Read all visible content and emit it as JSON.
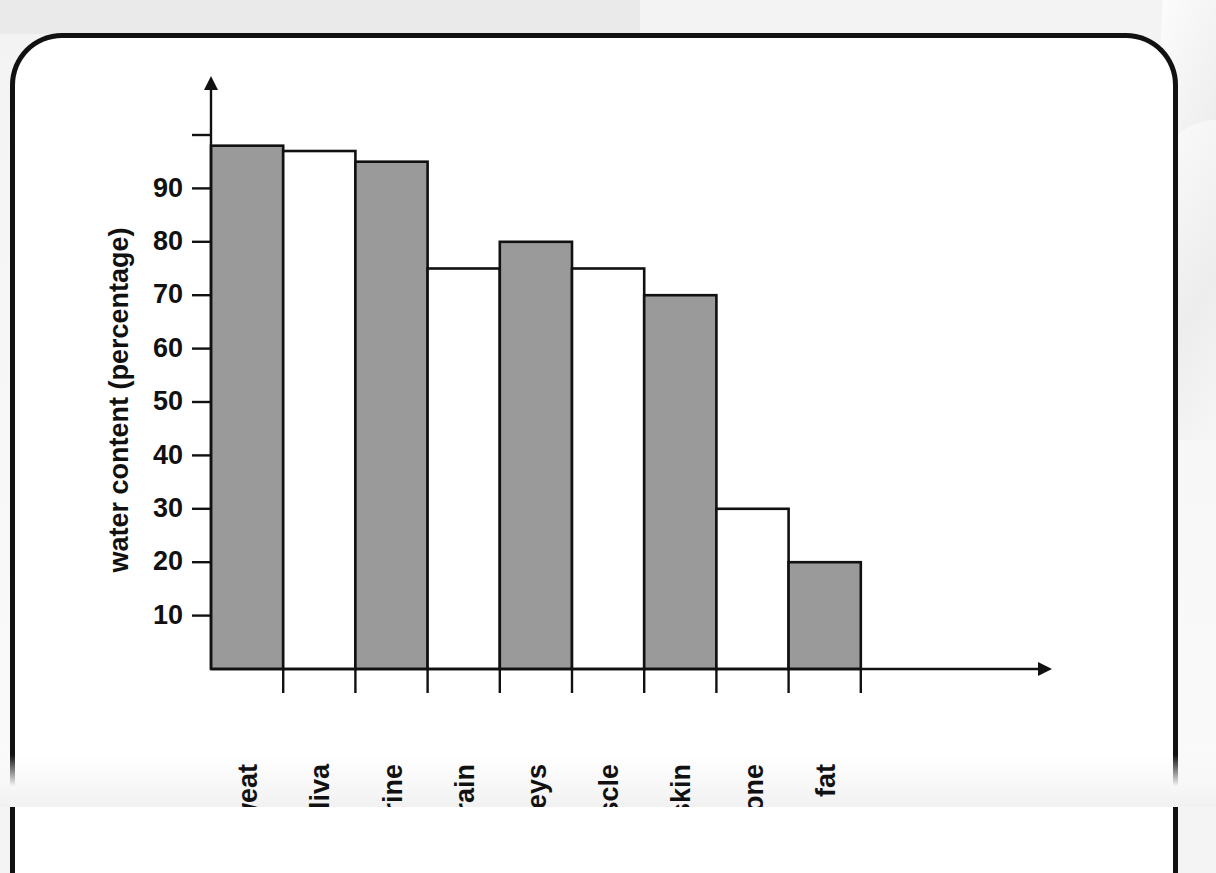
{
  "chart_data": {
    "type": "bar",
    "title": "",
    "xlabel": "",
    "ylabel": "water content (percentage)",
    "categories": [
      "sweat",
      "saliva",
      "urine",
      "brain",
      "kidneys",
      "muscle",
      "skin",
      "bone",
      "fat"
    ],
    "values": [
      98,
      97,
      95,
      75,
      80,
      75,
      70,
      30,
      20
    ],
    "bar_fills": [
      "gray",
      "white",
      "gray",
      "white",
      "gray",
      "white",
      "gray",
      "white",
      "gray"
    ],
    "ylim": [
      0,
      105
    ],
    "y_ticks": [
      10,
      20,
      30,
      40,
      50,
      60,
      70,
      80,
      90,
      100
    ],
    "y_tick_labels": [
      "10",
      "20",
      "30",
      "40",
      "50",
      "60",
      "70",
      "80",
      "90",
      ""
    ],
    "grid": false,
    "legend": "none",
    "axis_arrows": true,
    "colors": {
      "bar_gray": "#9a9a9a",
      "bar_white": "#ffffff",
      "outline": "#111111",
      "page": "#ffffff",
      "background": "#f4f4f4"
    }
  },
  "page": {
    "border_color": "#111111",
    "background_color": "#f4f4f4"
  }
}
